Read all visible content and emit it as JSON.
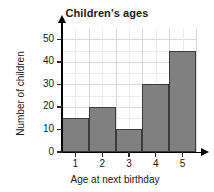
{
  "chart_data": {
    "type": "bar",
    "title": "Children's ages",
    "xlabel": "Age at next birthday",
    "ylabel": "Number of children",
    "categories": [
      "1",
      "2",
      "3",
      "4",
      "5"
    ],
    "values": [
      15,
      20,
      10,
      30,
      45
    ],
    "ylim": [
      0,
      55
    ],
    "yticks": [
      0,
      10,
      20,
      30,
      40,
      50
    ],
    "ytick_labels": [
      "0",
      "10",
      "20",
      "30",
      "40",
      "50"
    ],
    "xtick_labels": [
      "1",
      "2",
      "3",
      "4",
      "5"
    ],
    "grid": true,
    "grid_minor": true,
    "legend": null,
    "bar_color": "#808080",
    "bar_edge_color": "#3b3b3b",
    "grid_color": "#d9d9d9",
    "grid_minor_color": "#ececec",
    "axis_color": "#000000",
    "text_color": "#1a1a1a",
    "background": "#ffffff"
  }
}
